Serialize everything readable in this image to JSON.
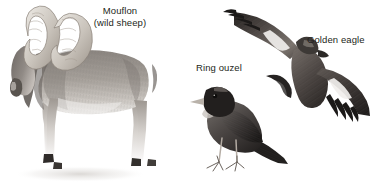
{
  "plate": {
    "title": "Mountain wildlife illustration plate",
    "background_color": "#ffffff",
    "width": 371,
    "height": 190,
    "medium": "pencil / graphite natural-history illustration"
  },
  "labels": {
    "mouflon": {
      "line1": "Mouflon",
      "line2": "(wild sheep)",
      "color": "#231f20"
    },
    "ring_ouzel": {
      "text": "Ring ouzel",
      "color": "#231f20"
    },
    "golden_eagle": {
      "text": "Golden eagle",
      "color": "#231f20"
    }
  },
  "figures": [
    {
      "name": "mouflon",
      "subject": "Mouflon (wild sheep) ram standing in left three-quarter view with large spiral horns",
      "tone": "#8f8a85",
      "accent": "#4a4542"
    },
    {
      "name": "ring-ouzel",
      "subject": "Ring ouzel perched facing left with white chest crescent and long tail",
      "tone": "#55504d",
      "accent": "#201d1c"
    },
    {
      "name": "golden-eagle",
      "subject": "Golden eagle soaring with wings spread, seen from above, white wing patches",
      "tone": "#6b6561",
      "accent": "#262322"
    }
  ]
}
